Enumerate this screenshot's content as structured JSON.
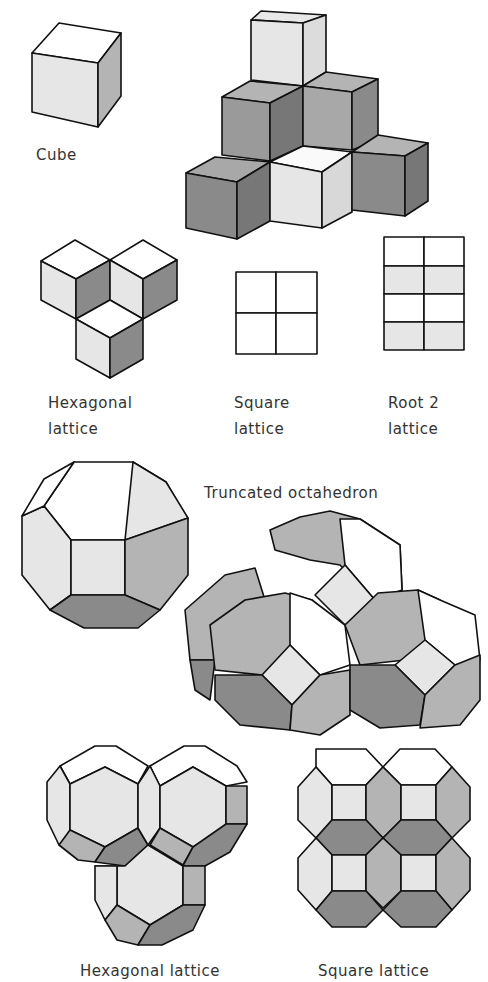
{
  "labels": {
    "cube": "Cube",
    "hex_lattice_line1": "Hexagonal",
    "hex_lattice_line2": "lattice",
    "square_lattice_line1": "Square",
    "square_lattice_line2": "lattice",
    "root2_lattice_line1": "Root 2",
    "root2_lattice_line2": "lattice",
    "truncated_octahedron": "Truncated octahedron",
    "to_hex_lattice": "Hexagonal lattice",
    "to_square_lattice": "Square lattice"
  },
  "colors": {
    "white": "#ffffff",
    "light": "#e6e6e6",
    "mid": "#b4b4b4",
    "dark": "#8a8a8a",
    "darker": "#777777",
    "stroke": "#111111"
  }
}
